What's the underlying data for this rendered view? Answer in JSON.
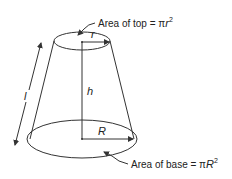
{
  "diagram": {
    "labels": {
      "top_area_prefix": "Area of top = ",
      "top_area_pi": "π",
      "top_area_var": "r",
      "top_area_exp": "2",
      "base_area_prefix": "Area of base = ",
      "base_area_pi": "π",
      "base_area_var": "R",
      "base_area_exp": "2",
      "top_radius": "r",
      "base_radius": "R",
      "height": "h",
      "slant_height": "l"
    },
    "colors": {
      "stroke": "#333333",
      "text": "#222222",
      "background": "#ffffff"
    }
  }
}
